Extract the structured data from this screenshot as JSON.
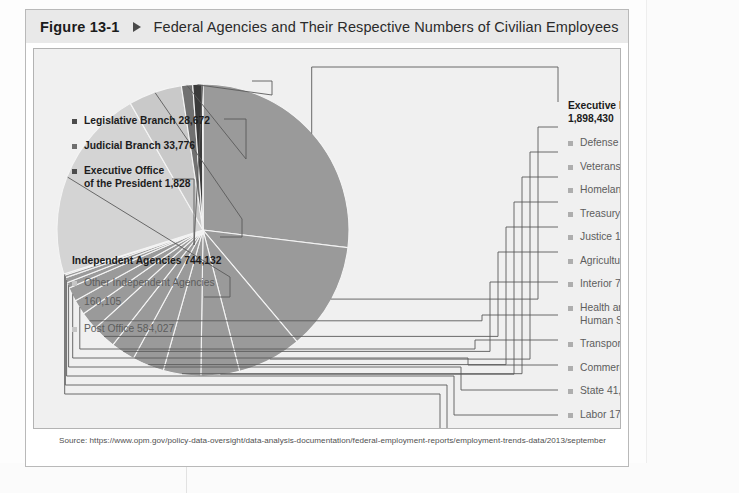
{
  "header": {
    "figure_number": "Figure 13-1",
    "marker_icon": "triangle-right-icon",
    "title": "Federal Agencies and Their Respective Numbers of Civilian Employees"
  },
  "source": "Source: https://www.opm.gov/policy-data-oversight/data-analysis-documentation/federal-employment-reports/employment-trends-data/2013/september",
  "legend_left_top": [
    {
      "label": "Legislative Branch 28,672",
      "bullet": "bullet-dark"
    },
    {
      "label": "Judicial Branch 33,776",
      "bullet": "bullet-mid"
    },
    {
      "label": "Executive Office",
      "label2": "of the President 1,828",
      "bullet": "bullet-dark"
    }
  ],
  "legend_independent": {
    "heading": "Independent Agencies 744,132",
    "items": [
      {
        "label": "Other Independent Agencies",
        "label2": "160,105",
        "bullet": "bullet-pale"
      },
      {
        "label": "Post Office 584,027",
        "bullet": "bullet-pale"
      }
    ]
  },
  "legend_right": {
    "heading_line1": "Executive Departments",
    "heading_line2": "1,898,430",
    "items": [
      {
        "label": "Defense 728,823"
      },
      {
        "label": "Veterans Affairs 323,208"
      },
      {
        "label": "Homeland Security 192,073"
      },
      {
        "label": "Treasury 112,461"
      },
      {
        "label": "Justice 115,616"
      },
      {
        "label": "Agriculture 95,223"
      },
      {
        "label": "Interior 71,543"
      },
      {
        "label": "Health and",
        "label2": "Human Services 72,703"
      },
      {
        "label": "Transportation 55,288"
      },
      {
        "label": "Commerce 45,035"
      },
      {
        "label": "State 41,768"
      },
      {
        "label": "Labor 17,187"
      },
      {
        "label": "Energy 15,213"
      },
      {
        "label": "Housing and",
        "label2": "Urban Development 8,123"
      },
      {
        "label": "Education 4,166"
      }
    ]
  },
  "colors": {
    "slice_main": "#9a9a9a",
    "slice_dark": "#3a3a3a",
    "slice_mid": "#707070",
    "slice_light": "#c9c9c9",
    "slice_pale": "#d4d4d4",
    "plate_bg": "#f0f0f0",
    "header_bg": "#e9e9e9",
    "frame": "#b9b9b9",
    "leader": "#5a5a5a"
  },
  "chart_data": {
    "type": "pie",
    "title": "Federal Agencies and Their Respective Numbers of Civilian Employees",
    "unit": "civilian employees",
    "total": 2706438,
    "legend_position": "left-and-right-with-leader-lines",
    "grid": false,
    "groups": [
      {
        "name": "Executive Departments",
        "total": 1898430
      },
      {
        "name": "Independent Agencies",
        "total": 744132
      },
      {
        "name": "Legislative Branch",
        "total": 28672
      },
      {
        "name": "Judicial Branch",
        "total": 33776
      },
      {
        "name": "Executive Office of the President",
        "total": 1828
      }
    ],
    "labels": [
      "Defense",
      "Veterans Affairs",
      "Homeland Security",
      "Justice",
      "Treasury",
      "Agriculture",
      "Health and Human Services",
      "Interior",
      "Transportation",
      "Commerce",
      "State",
      "Labor",
      "Energy",
      "Housing and Urban Development",
      "Education",
      "Post Office",
      "Other Independent Agencies",
      "Judicial Branch",
      "Legislative Branch",
      "Executive Office of the President"
    ],
    "values": [
      728823,
      323208,
      192073,
      115616,
      112461,
      95223,
      72703,
      71543,
      55288,
      45035,
      41768,
      17187,
      15213,
      8123,
      4166,
      584027,
      160105,
      33776,
      28672,
      1828
    ],
    "slice_colors": [
      "#9a9a9a",
      "#9a9a9a",
      "#9a9a9a",
      "#9a9a9a",
      "#9a9a9a",
      "#9a9a9a",
      "#9a9a9a",
      "#9a9a9a",
      "#9a9a9a",
      "#9a9a9a",
      "#9a9a9a",
      "#9a9a9a",
      "#9a9a9a",
      "#9a9a9a",
      "#9a9a9a",
      "#d4d4d4",
      "#c9c9c9",
      "#707070",
      "#3a3a3a",
      "#3a3a3a"
    ]
  }
}
